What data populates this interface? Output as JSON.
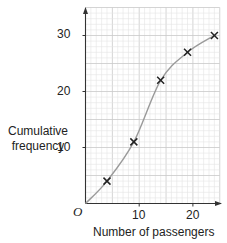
{
  "chart_data": {
    "type": "line",
    "title": "",
    "xlabel": "Number of passengers",
    "ylabel": "Cumulative frequency",
    "origin_label": "O",
    "x": [
      0,
      4,
      9,
      14,
      19,
      24
    ],
    "series": [
      {
        "name": "Cumulative frequency curve",
        "values": [
          0,
          4,
          11,
          22,
          27,
          30
        ],
        "marker": "x",
        "plotted_points": [
          [
            4,
            4
          ],
          [
            9,
            11
          ],
          [
            14,
            22
          ],
          [
            19,
            27
          ],
          [
            24,
            30
          ]
        ]
      }
    ],
    "x_ticks": [
      10,
      20
    ],
    "y_ticks": [
      10,
      20,
      30
    ],
    "xlim": [
      0,
      25
    ],
    "ylim": [
      0,
      35
    ],
    "grid": true,
    "minor_grid_step": 1,
    "major_grid_step": 5,
    "colors": {
      "grid_minor": "#e4e4e4",
      "grid_major": "#c9c9c9",
      "curve": "#9a9a9a",
      "axis": "#333333",
      "marker": "#222222"
    }
  },
  "labels": {
    "ylabel_line1": "Cumulative",
    "ylabel_line2": "frequency",
    "xlabel": "Number of passengers",
    "origin": "O",
    "x_tick_10": "10",
    "x_tick_20": "20",
    "y_tick_10": "10",
    "y_tick_20": "20",
    "y_tick_30": "30"
  }
}
